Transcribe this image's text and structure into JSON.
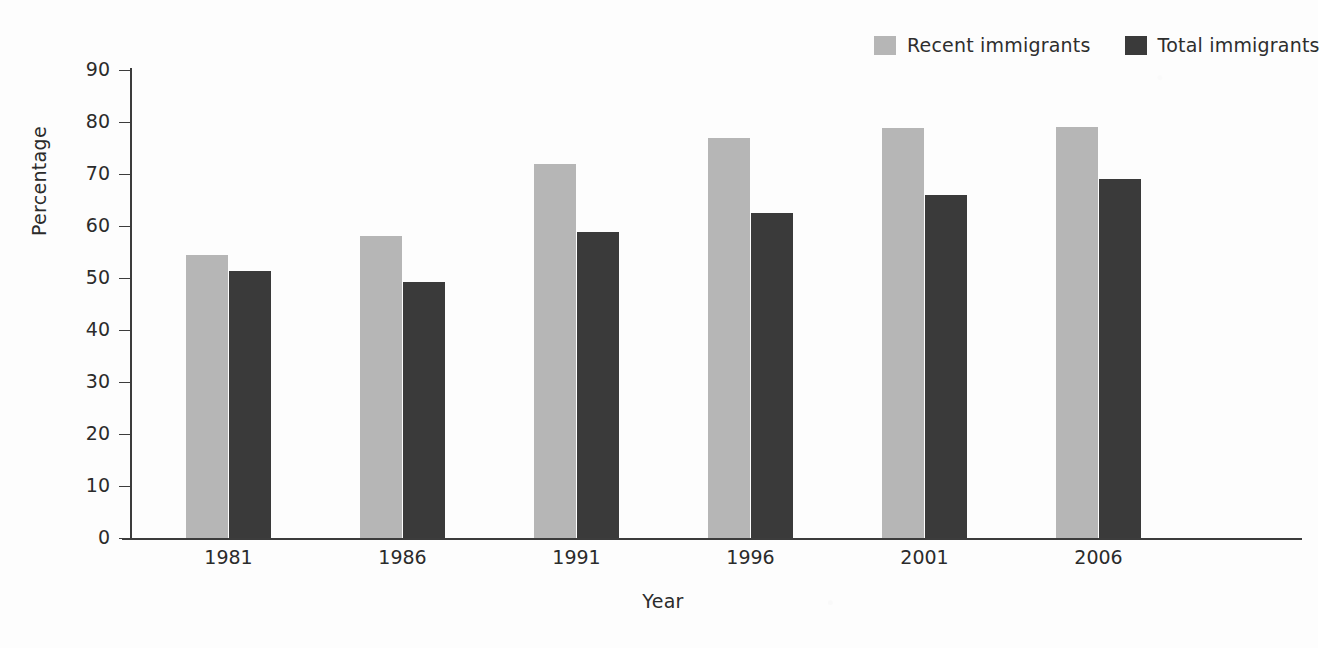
{
  "chart_data": {
    "type": "bar",
    "title": "",
    "subtitle": "",
    "xlabel": "Year",
    "ylabel": "Percentage",
    "categories": [
      "1981",
      "1986",
      "1991",
      "1996",
      "2001",
      "2006"
    ],
    "series": [
      {
        "name": "Recent immigrants",
        "color": "#b6b6b6",
        "values": [
          54.5,
          58.0,
          72.0,
          77.0,
          78.8,
          79.0
        ]
      },
      {
        "name": "Total immigrants",
        "color": "#3a3a3a",
        "values": [
          51.3,
          49.3,
          58.8,
          62.5,
          66.0,
          69.0
        ]
      }
    ],
    "ylim": [
      0,
      90
    ],
    "ytick_step": 10,
    "yticks": [
      "90",
      "80",
      "70",
      "60",
      "50",
      "40",
      "30",
      "20",
      "10",
      "0"
    ],
    "grid": false,
    "legend_position": "top-right",
    "annotations": []
  },
  "axis": {
    "y_title": "Percentage",
    "x_title": "Year"
  },
  "legend": {
    "entries": [
      {
        "label": "Recent immigrants",
        "color": "#b6b6b6"
      },
      {
        "label": "Total immigrants",
        "color": "#3a3a3a"
      }
    ]
  }
}
